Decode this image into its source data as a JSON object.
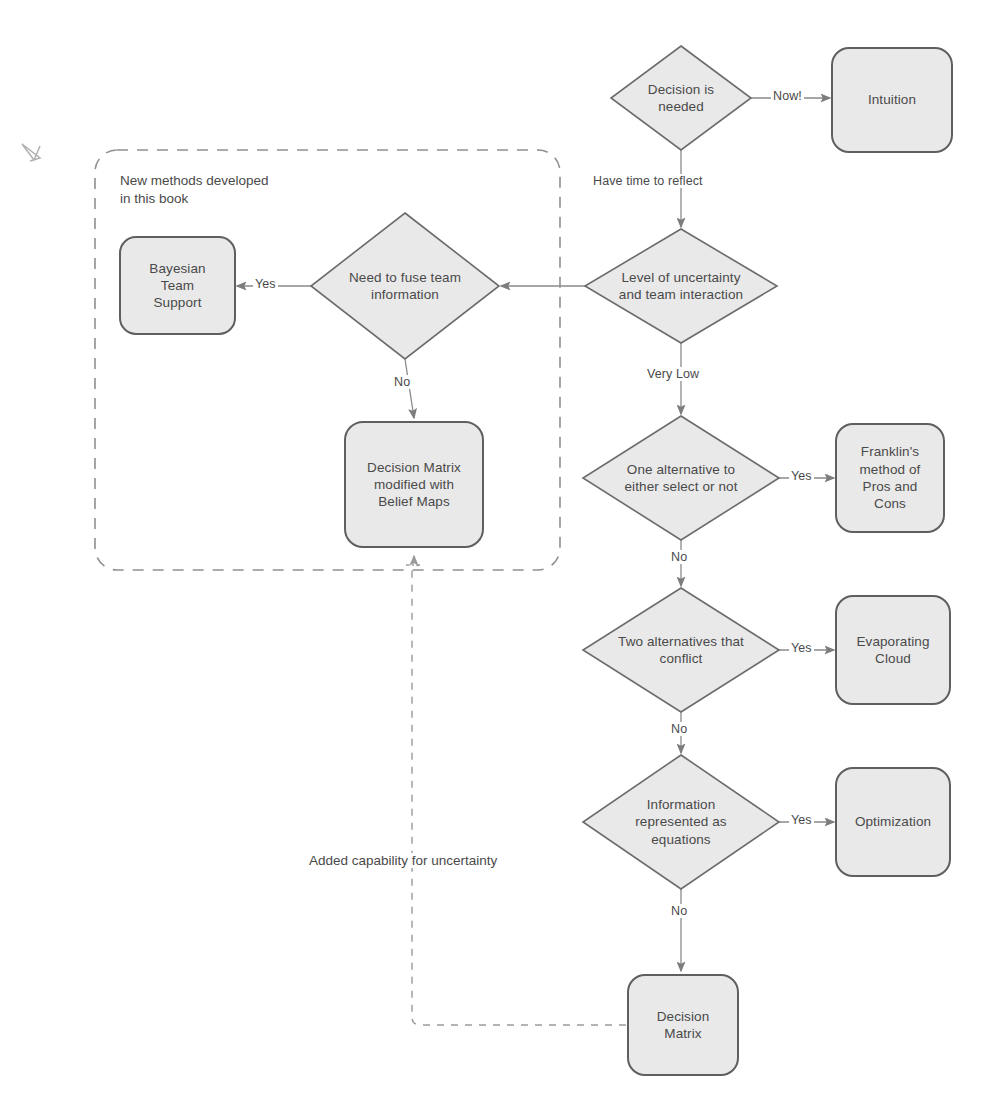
{
  "diagram": {
    "title_caption": "New methods developed\nin this book",
    "group_box": {
      "label": "New methods developed in this book",
      "style": "dashed-rounded",
      "x": 95,
      "y": 150,
      "w": 465,
      "h": 420
    },
    "colors": {
      "node_fill": "#e9e9e9",
      "node_stroke": "#6b6b6b",
      "text": "#4a4a4a",
      "edge": "#8a8a8a",
      "dashed_edge": "#9a9a9a",
      "background": "#ffffff"
    },
    "nodes": [
      {
        "id": "decision-needed",
        "shape": "diamond",
        "label": "Decision is\nneeded",
        "cx": 681,
        "cy": 98,
        "w": 140,
        "h": 104
      },
      {
        "id": "intuition",
        "shape": "rounded-rect",
        "label": "Intuition",
        "x": 832,
        "y": 48,
        "w": 120,
        "h": 104
      },
      {
        "id": "level-of-uncertainty",
        "shape": "diamond",
        "label": "Level of uncertainty\nand team interaction",
        "cx": 681,
        "cy": 286,
        "w": 192,
        "h": 114
      },
      {
        "id": "need-to-fuse",
        "shape": "diamond",
        "label": "Need to fuse team\ninformation",
        "cx": 405,
        "cy": 286,
        "w": 188,
        "h": 146
      },
      {
        "id": "bayesian-team-support",
        "shape": "rounded-rect",
        "label": "Bayesian\nTeam\nSupport",
        "x": 120,
        "y": 237,
        "w": 115,
        "h": 97
      },
      {
        "id": "decision-matrix-belief-maps",
        "shape": "rounded-rect",
        "label": "Decision Matrix\nmodified with\nBelief Maps",
        "x": 345,
        "y": 422,
        "w": 138,
        "h": 125
      },
      {
        "id": "one-alternative",
        "shape": "diamond",
        "label": "One alternative to\neither select or not",
        "cx": 681,
        "cy": 478,
        "w": 196,
        "h": 124
      },
      {
        "id": "franklins-method",
        "shape": "rounded-rect",
        "label": "Franklin's\nmethod of\nPros and\nCons",
        "x": 836,
        "y": 424,
        "w": 108,
        "h": 108
      },
      {
        "id": "two-alternatives",
        "shape": "diamond",
        "label": "Two alternatives that\nconflict",
        "cx": 681,
        "cy": 650,
        "w": 196,
        "h": 124
      },
      {
        "id": "evaporating-cloud",
        "shape": "rounded-rect",
        "label": "Evaporating\nCloud",
        "x": 836,
        "y": 596,
        "w": 114,
        "h": 108
      },
      {
        "id": "information-equations",
        "shape": "diamond",
        "label": "Information\nrepresented as\nequations",
        "cx": 681,
        "cy": 822,
        "w": 196,
        "h": 134
      },
      {
        "id": "optimization",
        "shape": "rounded-rect",
        "label": "Optimization",
        "x": 836,
        "y": 768,
        "w": 114,
        "h": 108
      },
      {
        "id": "decision-matrix",
        "shape": "rounded-rect",
        "label": "Decision\nMatrix",
        "x": 628,
        "y": 975,
        "w": 110,
        "h": 100
      }
    ],
    "edges": [
      {
        "id": "decision-to-intuition",
        "from": "decision-needed",
        "to": "intuition",
        "label": "Now!",
        "style": "solid"
      },
      {
        "id": "decision-to-uncertainty",
        "from": "decision-needed",
        "to": "level-of-uncertainty",
        "label": "Have time to reflect",
        "style": "solid"
      },
      {
        "id": "uncertainty-to-fuse",
        "from": "level-of-uncertainty",
        "to": "need-to-fuse",
        "label": "",
        "style": "solid"
      },
      {
        "id": "fuse-to-bayesian",
        "from": "need-to-fuse",
        "to": "bayesian-team-support",
        "label": "Yes",
        "style": "solid"
      },
      {
        "id": "fuse-to-belief-maps",
        "from": "need-to-fuse",
        "to": "decision-matrix-belief-maps",
        "label": "No",
        "style": "solid"
      },
      {
        "id": "uncertainty-to-one-alternative",
        "from": "level-of-uncertainty",
        "to": "one-alternative",
        "label": "Very Low",
        "style": "solid"
      },
      {
        "id": "one-alternative-to-franklin",
        "from": "one-alternative",
        "to": "franklins-method",
        "label": "Yes",
        "style": "solid"
      },
      {
        "id": "one-alternative-to-two-alternatives",
        "from": "one-alternative",
        "to": "two-alternatives",
        "label": "No",
        "style": "solid"
      },
      {
        "id": "two-alternatives-to-evaporating",
        "from": "two-alternatives",
        "to": "evaporating-cloud",
        "label": "Yes",
        "style": "solid"
      },
      {
        "id": "two-alternatives-to-information",
        "from": "two-alternatives",
        "to": "information-equations",
        "label": "No",
        "style": "solid"
      },
      {
        "id": "information-to-optimization",
        "from": "information-equations",
        "to": "optimization",
        "label": "Yes",
        "style": "solid"
      },
      {
        "id": "information-to-decision-matrix",
        "from": "information-equations",
        "to": "decision-matrix",
        "label": "No",
        "style": "solid"
      },
      {
        "id": "decision-matrix-to-belief-maps",
        "from": "decision-matrix",
        "to": "decision-matrix-belief-maps",
        "label": "Added capability for uncertainty",
        "style": "dashed"
      }
    ],
    "edge_labels": {
      "now": "Now!",
      "have_time": "Have time to reflect",
      "very_low": "Very Low",
      "yes_fuse": "Yes",
      "no_fuse": "No",
      "yes_one": "Yes",
      "no_one": "No",
      "yes_two": "Yes",
      "no_two": "No",
      "yes_info": "Yes",
      "no_info": "No",
      "added_capability": "Added capability for uncertainty"
    },
    "node_labels": {
      "decision_needed": "Decision is\nneeded",
      "intuition": "Intuition",
      "level_uncertainty": "Level of uncertainty\nand team interaction",
      "need_fuse": "Need to fuse team\ninformation",
      "bayesian": "Bayesian\nTeam\nSupport",
      "belief_maps": "Decision Matrix\nmodified with\nBelief Maps",
      "one_alternative": "One alternative to\neither select or not",
      "franklin": "Franklin's\nmethod of\nPros and\nCons",
      "two_alternatives": "Two alternatives that\nconflict",
      "evaporating": "Evaporating\nCloud",
      "information": "Information\nrepresented as\nequations",
      "optimization": "Optimization",
      "decision_matrix": "Decision\nMatrix"
    }
  }
}
